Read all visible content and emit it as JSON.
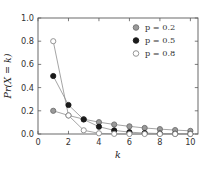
{
  "chart_data": {
    "type": "line",
    "title": "",
    "xlabel": "k",
    "ylabel": "Pr(X = k)",
    "xlim": [
      0,
      10.5
    ],
    "ylim": [
      0.0,
      1.0
    ],
    "xticks": [
      "0",
      "2",
      "4",
      "6",
      "8",
      "10"
    ],
    "xtick_values": [
      0,
      2,
      4,
      6,
      8,
      10
    ],
    "yticks": [
      "0.0",
      "0.2",
      "0.4",
      "0.6",
      "0.8",
      "1.0"
    ],
    "ytick_values": [
      0.0,
      0.2,
      0.4,
      0.6,
      0.8,
      1.0
    ],
    "grid": false,
    "legend_position": "top-right",
    "x": [
      1,
      2,
      3,
      4,
      5,
      6,
      7,
      8,
      9,
      10
    ],
    "series": [
      {
        "name": "p = 0.2",
        "p": 0.2,
        "marker": "circle-gray",
        "fill": "#9a9a9a",
        "stroke": "#6e6e6e",
        "values": [
          0.2,
          0.16,
          0.128,
          0.102,
          0.082,
          0.066,
          0.052,
          0.042,
          0.034,
          0.027
        ]
      },
      {
        "name": "p = 0.5",
        "p": 0.5,
        "marker": "circle-black",
        "fill": "#1a1a1a",
        "stroke": "#1a1a1a",
        "values": [
          0.5,
          0.25,
          0.125,
          0.063,
          0.031,
          0.016,
          0.008,
          0.004,
          0.002,
          0.001
        ]
      },
      {
        "name": "p = 0.8",
        "p": 0.8,
        "marker": "circle-open",
        "fill": "#ffffff",
        "stroke": "#8a8a8a",
        "values": [
          0.8,
          0.16,
          0.032,
          0.006,
          0.001,
          0.0,
          0.0,
          0.0,
          0.0,
          0.0
        ]
      }
    ],
    "line_color": "#8e8e8e",
    "axis_color": "#5a5a5a",
    "background": "#ffffff"
  }
}
